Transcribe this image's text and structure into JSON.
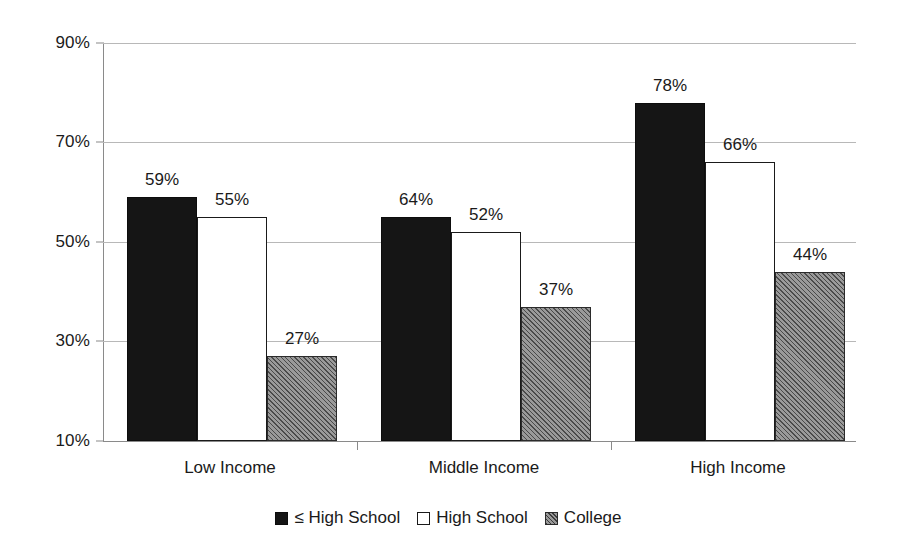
{
  "chart_data": {
    "type": "bar",
    "title": "",
    "subtitle": "",
    "xlabel": "",
    "ylabel": "",
    "categories": [
      "Low Income",
      "Middle Income",
      "High Income"
    ],
    "series": [
      {
        "name": "≤ High School",
        "values": [
          59,
          55,
          78
        ],
        "style": "solid-black",
        "color": "#151515"
      },
      {
        "name": "High School",
        "values": [
          55,
          52,
          66
        ],
        "style": "outlined-white",
        "color": "#ffffff"
      },
      {
        "name": "College",
        "values": [
          27,
          37,
          44
        ],
        "style": "diagonal-hatch-gray",
        "color": "#9a9a9a"
      }
    ],
    "value_suffix": "%",
    "data_labels": [
      [
        "59%",
        "55%",
        "27%"
      ],
      [
        "64%",
        "52%",
        "37%"
      ],
      [
        "78%",
        "66%",
        "44%"
      ]
    ],
    "ylim": [
      10,
      90
    ],
    "yticks": [
      10,
      30,
      50,
      70,
      90
    ],
    "ytick_labels": [
      "10%",
      "30%",
      "50%",
      "70%",
      "90%"
    ],
    "grid": true,
    "grid_axis": "y",
    "legend_position": "bottom",
    "legend_entries": [
      "≤ High School",
      "High School",
      "College"
    ],
    "background": "#ffffff",
    "gridline_color": "#b8b8b8",
    "axis_color": "#8a8a8a",
    "text_color": "#1a1a1a"
  },
  "note_series_group_values": {
    "Low Income": {
      "le_high_school": 59,
      "high_school": 55,
      "college": 27
    },
    "Middle Income": {
      "le_high_school": 64,
      "high_school": 52,
      "college": 37
    },
    "High Income": {
      "le_high_school": 78,
      "high_school": 66,
      "college": 44
    }
  }
}
